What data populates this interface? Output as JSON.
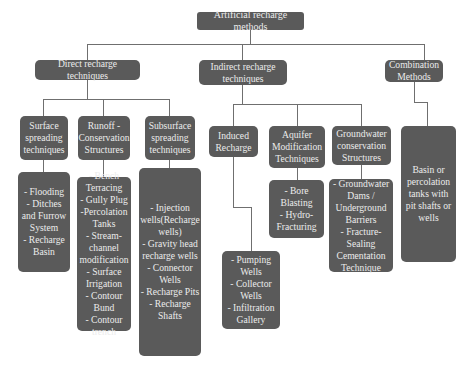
{
  "diagram": {
    "title": "Artificial recharge methods",
    "level1": [
      {
        "id": "direct",
        "label": "Direct recharge techniques"
      },
      {
        "id": "indirect",
        "label": "Indirect recharge\ntechniques"
      },
      {
        "id": "combination",
        "label": "Combination\nMethods"
      }
    ],
    "level2": [
      {
        "id": "surface",
        "parent": "direct",
        "label": "Surface\nspreading\ntechniques"
      },
      {
        "id": "runoff",
        "parent": "direct",
        "label": "Runoff -\nConservation\nStructures"
      },
      {
        "id": "subsurface",
        "parent": "direct",
        "label": "Subsurface\nspreading\ntechniques"
      },
      {
        "id": "induced",
        "parent": "indirect",
        "label": "Induced\nRecharge"
      },
      {
        "id": "aquifer",
        "parent": "indirect",
        "label": "Aquifer\nModification\nTechniques"
      },
      {
        "id": "groundwater",
        "parent": "indirect",
        "label": "Groundwater\nconservation\nStructures"
      }
    ],
    "leaves": [
      {
        "id": "surface-items",
        "parent": "surface",
        "label": "- Flooding\n- Ditches\nand Furrow\nSystem\n- Recharge\nBasin"
      },
      {
        "id": "runoff-items",
        "parent": "runoff",
        "label": "- Bench\nTerracing\n- Gully Plug\n-Percolation\nTanks\n- Stream-\nchannel\nmodification\n- Surface\nIrrigation\n- Contour\nBund\n- Contour\ntrench"
      },
      {
        "id": "subsurface-items",
        "parent": "subsurface",
        "label": "- Injection\nwells(Recharge\nwells)\n- Gravity head\nrecharge wells\n- Connector\nWells\n- Recharge Pits\n- Recharge\nShafts"
      },
      {
        "id": "induced-items",
        "parent": "induced",
        "label": "- Pumping\nWells\n- Collector\nWells\n- Infiltration\nGallery"
      },
      {
        "id": "aquifer-items",
        "parent": "aquifer",
        "label": "- Bore\nBlasting\n- Hydro-\nFracturing"
      },
      {
        "id": "groundwater-items",
        "parent": "groundwater",
        "label": "- Groundwater\nDams /\nUnderground\nBarriers\n- Fracture-\nSealing\nCementation\nTechnique"
      },
      {
        "id": "combination-items",
        "parent": "combination",
        "label": "Basin or\npercolation\ntanks with\npit shafts or\nwells"
      }
    ]
  },
  "colors": {
    "box_fill": "#5a5a5a",
    "box_text": "#ececec",
    "connector": "#6f6f6f",
    "background": "#ffffff"
  }
}
